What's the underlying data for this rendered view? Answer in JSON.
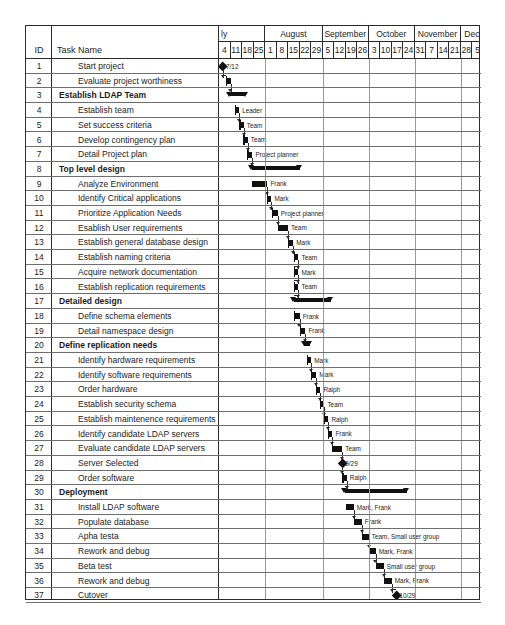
{
  "chart_data": {
    "type": "bar",
    "chart_kind": "gantt",
    "title": "",
    "xlabel": "",
    "ylabel": "",
    "grid": true,
    "legend_position": "none",
    "columns": [
      "ID",
      "Task Name"
    ],
    "timescale": {
      "months": [
        {
          "label": "ly",
          "weeks": 4,
          "truncated": true
        },
        {
          "label": "August",
          "weeks": 5
        },
        {
          "label": "September",
          "weeks": 4
        },
        {
          "label": "October",
          "weeks": 4
        },
        {
          "label": "November",
          "weeks": 4
        },
        {
          "label": "Dec",
          "weeks": 2
        }
      ],
      "week_ticks": [
        "4",
        "11",
        "18",
        "25",
        "1",
        "8",
        "15",
        "22",
        "29",
        "5",
        "12",
        "19",
        "26",
        "3",
        "10",
        "17",
        "24",
        "31",
        "7",
        "14",
        "21",
        "28",
        "5"
      ]
    },
    "tasks": [
      {
        "id": "1",
        "name": "Start project",
        "level": 1,
        "bar_type": "milestone",
        "start_week": 0.35,
        "end_week": 0.35,
        "resources": "",
        "date_label": "7/12"
      },
      {
        "id": "2",
        "name": "Evaluate project worthiness",
        "level": 1,
        "bar_type": "task",
        "start_week": 0.6,
        "end_week": 1.0,
        "resources": ""
      },
      {
        "id": "3",
        "name": "Establish LDAP Team",
        "level": 0,
        "bar_type": "summary",
        "start_week": 0.95,
        "end_week": 2.3,
        "resources": ""
      },
      {
        "id": "4",
        "name": "Establish team",
        "level": 1,
        "bar_type": "task",
        "start_week": 1.35,
        "end_week": 1.75,
        "resources": "Leader"
      },
      {
        "id": "5",
        "name": "Set success criteria",
        "level": 1,
        "bar_type": "task",
        "start_week": 1.75,
        "end_week": 2.15,
        "resources": "Team"
      },
      {
        "id": "6",
        "name": "Develop contingency plan",
        "level": 1,
        "bar_type": "task",
        "start_week": 2.1,
        "end_week": 2.5,
        "resources": "Team"
      },
      {
        "id": "7",
        "name": "Detail Project plan",
        "level": 1,
        "bar_type": "task",
        "start_week": 2.4,
        "end_week": 2.9,
        "resources": "Project planner"
      },
      {
        "id": "8",
        "name": "Top level design",
        "level": 0,
        "bar_type": "summary",
        "start_week": 2.85,
        "end_week": 7.0,
        "resources": ""
      },
      {
        "id": "9",
        "name": "Analyze Environment",
        "level": 1,
        "bar_type": "task",
        "start_week": 2.9,
        "end_week": 4.2,
        "resources": "Frank"
      },
      {
        "id": "10",
        "name": "Identify Critical applications",
        "level": 1,
        "bar_type": "task",
        "start_week": 4.15,
        "end_week": 4.55,
        "resources": "Mark"
      },
      {
        "id": "11",
        "name": "Prioritize Application Needs",
        "level": 1,
        "bar_type": "task",
        "start_week": 4.6,
        "end_week": 5.1,
        "resources": "Project planner"
      },
      {
        "id": "12",
        "name": "Esablish User requirements",
        "level": 1,
        "bar_type": "task",
        "start_week": 5.1,
        "end_week": 6.0,
        "resources": "Team"
      },
      {
        "id": "13",
        "name": "Establish general database design",
        "level": 1,
        "bar_type": "task",
        "start_week": 5.95,
        "end_week": 6.45,
        "resources": "Mark"
      },
      {
        "id": "14",
        "name": "Establish naming criteria",
        "level": 1,
        "bar_type": "task",
        "start_week": 6.5,
        "end_week": 6.9,
        "resources": "Team"
      },
      {
        "id": "15",
        "name": "Acquire network documentation",
        "level": 1,
        "bar_type": "task",
        "start_week": 6.5,
        "end_week": 6.9,
        "resources": "Mark"
      },
      {
        "id": "16",
        "name": "Establish replication requirements",
        "level": 1,
        "bar_type": "task",
        "start_week": 6.5,
        "end_week": 6.9,
        "resources": "Team"
      },
      {
        "id": "17",
        "name": "Detailed design",
        "level": 0,
        "bar_type": "summary",
        "start_week": 6.5,
        "end_week": 9.7,
        "resources": ""
      },
      {
        "id": "18",
        "name": "Define schema elements",
        "level": 1,
        "bar_type": "task",
        "start_week": 6.5,
        "end_week": 7.0,
        "resources": "Frank"
      },
      {
        "id": "19",
        "name": "Detail namespace design",
        "level": 1,
        "bar_type": "task",
        "start_week": 7.0,
        "end_week": 7.5,
        "resources": "Frank"
      },
      {
        "id": "20",
        "name": "Define replication needs",
        "level": 0,
        "bar_type": "summary",
        "start_week": 7.4,
        "end_week": 7.9,
        "resources": ""
      },
      {
        "id": "21",
        "name": "Identify hardware requirements",
        "level": 1,
        "bar_type": "task",
        "start_week": 7.6,
        "end_week": 8.0,
        "resources": "Mark"
      },
      {
        "id": "22",
        "name": "Identify software requirements",
        "level": 1,
        "bar_type": "task",
        "start_week": 7.95,
        "end_week": 8.45,
        "resources": "Mark"
      },
      {
        "id": "23",
        "name": "Order hardware",
        "level": 1,
        "bar_type": "task",
        "start_week": 8.4,
        "end_week": 8.8,
        "resources": "Ralph"
      },
      {
        "id": "24",
        "name": "Establish security schema",
        "level": 1,
        "bar_type": "task",
        "start_week": 8.75,
        "end_week": 9.15,
        "resources": "Team"
      },
      {
        "id": "25",
        "name": "Establish maintenence requirements",
        "level": 1,
        "bar_type": "task",
        "start_week": 9.1,
        "end_week": 9.5,
        "resources": "Ralph"
      },
      {
        "id": "26",
        "name": "Identify candidate LDAP servers",
        "level": 1,
        "bar_type": "task",
        "start_week": 9.45,
        "end_week": 9.85,
        "resources": "Frank"
      },
      {
        "id": "27",
        "name": "Evaluate candidate LDAP servers",
        "level": 1,
        "bar_type": "task",
        "start_week": 9.8,
        "end_week": 10.7,
        "resources": "Team"
      },
      {
        "id": "28",
        "name": "Server Selected",
        "level": 1,
        "bar_type": "milestone",
        "start_week": 10.7,
        "end_week": 10.7,
        "resources": "",
        "date_label": "9/29"
      },
      {
        "id": "29",
        "name": "Order software",
        "level": 1,
        "bar_type": "task",
        "start_week": 10.7,
        "end_week": 11.1,
        "resources": "Ralph"
      },
      {
        "id": "30",
        "name": "Deployment",
        "level": 0,
        "bar_type": "summary",
        "start_week": 10.9,
        "end_week": 16.3,
        "resources": ""
      },
      {
        "id": "31",
        "name": "Install LDAP software",
        "level": 1,
        "bar_type": "task",
        "start_week": 11.0,
        "end_week": 11.7,
        "resources": "Mark, Frank"
      },
      {
        "id": "32",
        "name": "Populate database",
        "level": 1,
        "bar_type": "task",
        "start_week": 11.7,
        "end_week": 12.4,
        "resources": "Frank"
      },
      {
        "id": "33",
        "name": "Apha testa",
        "level": 1,
        "bar_type": "task",
        "start_week": 12.4,
        "end_week": 13.0,
        "resources": "Team, Small user group"
      },
      {
        "id": "34",
        "name": "Rework and debug",
        "level": 1,
        "bar_type": "task",
        "start_week": 13.0,
        "end_week": 13.6,
        "resources": "Mark, Frank"
      },
      {
        "id": "35",
        "name": "Beta test",
        "level": 1,
        "bar_type": "task",
        "start_week": 13.6,
        "end_week": 14.3,
        "resources": "Small user group"
      },
      {
        "id": "36",
        "name": "Rework and debug",
        "level": 1,
        "bar_type": "task",
        "start_week": 14.3,
        "end_week": 15.0,
        "resources": "Mark, Frank"
      },
      {
        "id": "37",
        "name": "Cutover",
        "level": 1,
        "bar_type": "milestone",
        "start_week": 15.4,
        "end_week": 15.4,
        "resources": "",
        "date_label": "10/29"
      }
    ]
  },
  "colors": {
    "bar": "#111111",
    "grid": "#6e6e6e",
    "frame": "#2b2b2b",
    "text": "#1c1c1c",
    "background": "#ffffff"
  }
}
